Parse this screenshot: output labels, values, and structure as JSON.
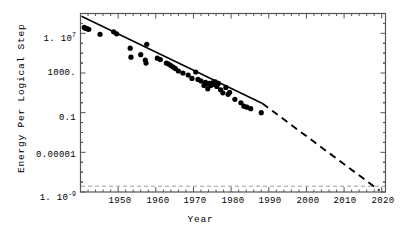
{
  "chart_data": {
    "type": "scatter",
    "title": "",
    "xlabel": "Year",
    "ylabel": "Energy Per Logical Step",
    "xlim": [
      1940,
      2021
    ],
    "ylim_log10": [
      -9,
      9
    ],
    "yscale": "log",
    "grid": false,
    "legend": null,
    "x_ticks": [
      1950,
      1960,
      1970,
      1980,
      1990,
      2000,
      2010,
      2020
    ],
    "x_tick_labels": [
      "1950",
      "1960",
      "1970",
      "1980",
      "1990",
      "2000",
      "2010",
      "2020"
    ],
    "y_ticks_log10": [
      7,
      3,
      -1,
      -5,
      -9
    ],
    "y_tick_labels": [
      {
        "mantissa": "1. 10",
        "exponent": "7"
      },
      {
        "mantissa": "1000.",
        "exponent": ""
      },
      {
        "mantissa": "0.1",
        "exponent": ""
      },
      {
        "mantissa": "0.00001",
        "exponent": ""
      },
      {
        "mantissa": "1. 10",
        "exponent": "-9"
      }
    ],
    "series": [
      {
        "name": "Energy per logical step",
        "marker": "filled-circle",
        "color": "#000000",
        "points": [
          [
            1941.0,
            7.6
          ],
          [
            1941.4,
            7.5
          ],
          [
            1941.8,
            7.45
          ],
          [
            1942.2,
            7.4
          ],
          [
            1945.2,
            6.9
          ],
          [
            1948.8,
            7.15
          ],
          [
            1949.6,
            6.95
          ],
          [
            1953.2,
            5.5
          ],
          [
            1953.4,
            4.6
          ],
          [
            1956.0,
            4.85
          ],
          [
            1957.2,
            4.3
          ],
          [
            1957.4,
            4.0
          ],
          [
            1957.6,
            5.9
          ],
          [
            1960.4,
            4.5
          ],
          [
            1961.2,
            4.35
          ],
          [
            1962.8,
            4.0
          ],
          [
            1963.4,
            3.9
          ],
          [
            1964.0,
            3.75
          ],
          [
            1964.6,
            3.6
          ],
          [
            1965.2,
            3.45
          ],
          [
            1966.0,
            3.2
          ],
          [
            1967.2,
            3.0
          ],
          [
            1968.6,
            2.8
          ],
          [
            1969.6,
            2.45
          ],
          [
            1970.6,
            3.1
          ],
          [
            1971.2,
            2.35
          ],
          [
            1972.0,
            2.2
          ],
          [
            1972.8,
            1.75
          ],
          [
            1973.2,
            2.05
          ],
          [
            1973.6,
            1.9
          ],
          [
            1973.8,
            1.4
          ],
          [
            1974.2,
            1.95
          ],
          [
            1974.6,
            1.75
          ],
          [
            1975.0,
            2.0
          ],
          [
            1975.4,
            1.85
          ],
          [
            1975.8,
            2.1
          ],
          [
            1976.2,
            1.65
          ],
          [
            1976.6,
            1.95
          ],
          [
            1977.2,
            1.3
          ],
          [
            1977.8,
            1.0
          ],
          [
            1978.6,
            1.55
          ],
          [
            1979.2,
            0.85
          ],
          [
            1979.6,
            1.05
          ],
          [
            1981.0,
            0.35
          ],
          [
            1982.6,
            0.0
          ],
          [
            1983.4,
            -0.35
          ],
          [
            1984.2,
            -0.45
          ],
          [
            1985.2,
            -0.6
          ],
          [
            1988.0,
            -1.0
          ]
        ]
      }
    ],
    "fit_line": {
      "name": "trend-fit",
      "style_solid_from": [
        1941.0,
        7.65
      ],
      "style_solid_to": [
        1988.5,
        -1.1
      ],
      "style_dashed_from": [
        1988.5,
        -1.1
      ],
      "style_dashed_to": [
        2018.5,
        -8.8
      ],
      "color": "#000000"
    },
    "reference_line": {
      "name": "thermodynamic-limit",
      "orientation": "horizontal",
      "y_log10": -8.6,
      "style": "dashed",
      "color": "#9a9a9a"
    }
  },
  "axes": {
    "x_title": "Year",
    "y_title": "Energy Per Logical Step"
  },
  "colors": {
    "frame": "#555555",
    "marker": "#000000",
    "fit": "#000000",
    "reference": "#9a9a9a",
    "background": "#ffffff"
  }
}
